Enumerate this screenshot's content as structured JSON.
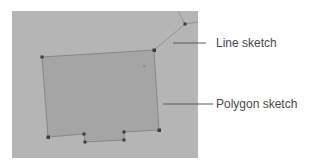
{
  "figure": {
    "panel": {
      "x": 12,
      "y": 11,
      "width": 186,
      "height": 147,
      "fill": "#b5b5b5"
    },
    "polygon_sketch": {
      "label": "Polygon sketch",
      "fill": "#a5a5a5",
      "stroke": "#7c7c7c",
      "vertices": [
        [
          42,
          57
        ],
        [
          154,
          50
        ],
        [
          159,
          130
        ],
        [
          124,
          132
        ],
        [
          124,
          140
        ],
        [
          85,
          142
        ],
        [
          84,
          134
        ],
        [
          48,
          137
        ]
      ]
    },
    "line_sketch": {
      "label": "Line sketch",
      "stroke": "#8a8a8a",
      "points": [
        [
          154,
          50
        ],
        [
          185,
          24
        ],
        [
          178,
          11
        ]
      ],
      "branch": [
        [
          185,
          24
        ],
        [
          198,
          22
        ]
      ],
      "vertices": [
        [
          185,
          24
        ]
      ]
    },
    "stray_point": [
      144,
      66
    ],
    "callouts": [
      {
        "label": "Line sketch",
        "line": [
          [
            173,
            43
          ],
          [
            206,
            43
          ]
        ],
        "text_x": 216,
        "text_y": 36
      },
      {
        "label": "Polygon sketch",
        "line": [
          [
            163,
            104
          ],
          [
            213,
            104
          ]
        ],
        "text_x": 216,
        "text_y": 97
      }
    ],
    "vertex_color": "#3c3c3c",
    "leader_color": "#5a5a5a"
  }
}
